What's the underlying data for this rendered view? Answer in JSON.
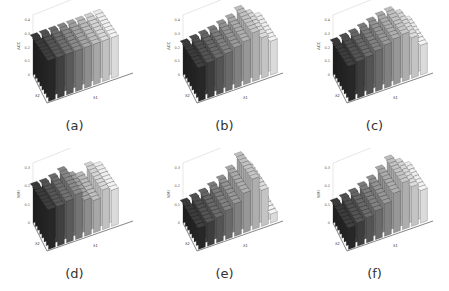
{
  "figure": {
    "panels": [
      {
        "id": "a",
        "caption": "(a)",
        "metric": "ACC",
        "ymax": 0.4,
        "yticks": [
          "0",
          "0.1",
          "0.2",
          "0.3",
          "0.4"
        ]
      },
      {
        "id": "b",
        "caption": "(b)",
        "metric": "ACC",
        "ymax": 0.4,
        "yticks": [
          "0",
          "0.1",
          "0.2",
          "0.3",
          "0.4"
        ]
      },
      {
        "id": "c",
        "caption": "(c)",
        "metric": "ACC",
        "ymax": 0.4,
        "yticks": [
          "0",
          "0.1",
          "0.2",
          "0.3",
          "0.4"
        ]
      },
      {
        "id": "d",
        "caption": "(d)",
        "metric": "NMI",
        "ymax": 0.3,
        "yticks": [
          "0",
          "0.1",
          "0.2",
          "0.3"
        ]
      },
      {
        "id": "e",
        "caption": "(e)",
        "metric": "NMI",
        "ymax": 0.3,
        "yticks": [
          "0",
          "0.1",
          "0.2",
          "0.3"
        ]
      },
      {
        "id": "f",
        "caption": "(f)",
        "metric": "NMI",
        "ymax": 0.3,
        "yticks": [
          "0",
          "0.1",
          "0.2",
          "0.3"
        ]
      }
    ],
    "x_axis_label": "λ1",
    "y_axis_label": "λ2"
  },
  "chart_data": [
    {
      "type": "bar3d",
      "title": "(a)",
      "zlabel": "ACC",
      "xlabel": "λ1",
      "ylabel": "λ2",
      "zlim": [
        0,
        0.4
      ],
      "x": [
        -3,
        -2,
        -1,
        0,
        1,
        2,
        3,
        4
      ],
      "y": [
        -3,
        -2,
        -1,
        0,
        1,
        2,
        3,
        4
      ],
      "values": [
        [
          0.3,
          0.3,
          0.3,
          0.3,
          0.3,
          0.3,
          0.3,
          0.3
        ],
        [
          0.31,
          0.31,
          0.31,
          0.31,
          0.31,
          0.31,
          0.31,
          0.31
        ],
        [
          0.33,
          0.33,
          0.32,
          0.32,
          0.32,
          0.32,
          0.32,
          0.32
        ],
        [
          0.32,
          0.32,
          0.31,
          0.31,
          0.31,
          0.31,
          0.31,
          0.31
        ],
        [
          0.3,
          0.3,
          0.3,
          0.3,
          0.3,
          0.3,
          0.3,
          0.3
        ],
        [
          0.28,
          0.28,
          0.28,
          0.28,
          0.28,
          0.28,
          0.28,
          0.28
        ],
        [
          0.35,
          0.34,
          0.32,
          0.3,
          0.27,
          0.24,
          0.21,
          0.18
        ],
        [
          0.36,
          0.35,
          0.33,
          0.3,
          0.27,
          0.24,
          0.2,
          0.16
        ]
      ]
    },
    {
      "type": "bar3d",
      "title": "(b)",
      "zlabel": "ACC",
      "xlabel": "λ1",
      "ylabel": "λ2",
      "zlim": [
        0,
        0.4
      ],
      "x": [
        -3,
        -2,
        -1,
        0,
        1,
        2,
        3,
        4,
        5
      ],
      "y": [
        -3,
        -2,
        -1,
        0,
        1,
        2,
        3,
        4
      ],
      "values": [
        [
          0.25,
          0.26,
          0.27,
          0.28,
          0.3,
          0.32,
          0.36,
          0.3,
          0.25
        ]
      ]
    },
    {
      "type": "bar3d",
      "title": "(c)",
      "zlabel": "ACC",
      "xlabel": "λ1",
      "ylabel": "λ2",
      "zlim": [
        0,
        0.4
      ],
      "x": [
        -3,
        -2,
        -1,
        0,
        1,
        2,
        3,
        4,
        5
      ],
      "y": [
        -3,
        -2,
        -1,
        0,
        1,
        2,
        3,
        4
      ],
      "values": [
        [
          0.26,
          0.27,
          0.28,
          0.3,
          0.32,
          0.34,
          0.35,
          0.3,
          0.22
        ]
      ]
    },
    {
      "type": "bar3d",
      "title": "(d)",
      "zlabel": "NMI",
      "xlabel": "λ1",
      "ylabel": "λ2",
      "zlim": [
        0,
        0.3
      ],
      "x": [
        -3,
        -2,
        -1,
        0,
        1,
        2,
        3,
        4
      ],
      "y": [
        -3,
        -2,
        -1,
        0,
        1,
        2,
        3,
        4
      ],
      "values": [
        [
          0.22,
          0.22,
          0.23,
          0.25,
          0.2,
          0.18,
          0.22,
          0.2
        ]
      ]
    },
    {
      "type": "bar3d",
      "title": "(e)",
      "zlabel": "NMI",
      "xlabel": "λ1",
      "ylabel": "λ2",
      "zlim": [
        0,
        0.3
      ],
      "x": [
        -3,
        -2,
        -1,
        0,
        1,
        2,
        3,
        4,
        5
      ],
      "y": [
        -3,
        -2,
        -1,
        0,
        1,
        2,
        3,
        4
      ],
      "values": [
        [
          0.12,
          0.13,
          0.14,
          0.16,
          0.18,
          0.22,
          0.28,
          0.2,
          0.05
        ]
      ]
    },
    {
      "type": "bar3d",
      "title": "(f)",
      "zlabel": "NMI",
      "xlabel": "λ1",
      "ylabel": "λ2",
      "zlim": [
        0,
        0.3
      ],
      "x": [
        -3,
        -2,
        -1,
        0,
        1,
        2,
        3,
        4,
        5
      ],
      "y": [
        -3,
        -2,
        -1,
        0,
        1,
        2,
        3,
        4
      ],
      "values": [
        [
          0.12,
          0.13,
          0.14,
          0.16,
          0.18,
          0.22,
          0.26,
          0.22,
          0.18
        ]
      ]
    }
  ]
}
